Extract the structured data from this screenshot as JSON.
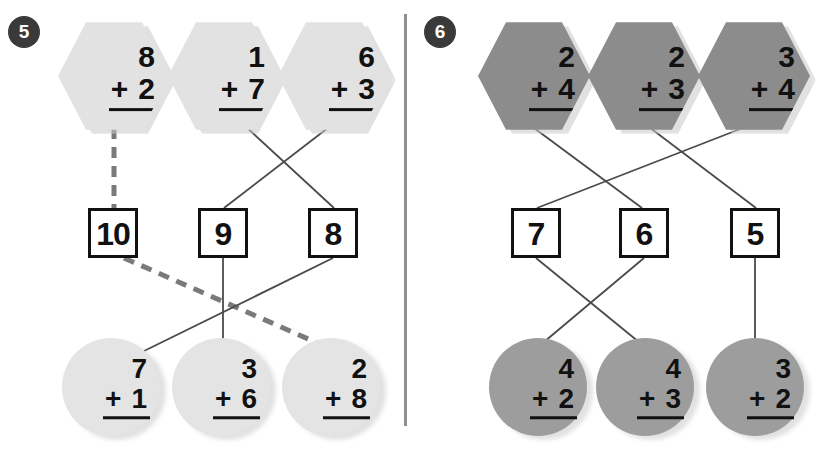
{
  "page": {
    "background": "#ffffff",
    "width": 818,
    "height": 453,
    "divider_color": "#8f8f8f"
  },
  "colors": {
    "hex_light": "#e2e2e2",
    "hex_dark": "#8c8c8c",
    "circle_light": "#e4e4e4",
    "circle_dark": "#9d9d9d",
    "ink": "#111111",
    "badge": "#3a3a3a",
    "solid_line": "#4a4a4a",
    "dashed_line": "#7a7a7a"
  },
  "problems": [
    {
      "number": "5",
      "top_row": [
        {
          "shape": "hexagon",
          "top": "8",
          "plus": "+",
          "bottom": "2"
        },
        {
          "shape": "hexagon",
          "top": "1",
          "plus": "+",
          "bottom": "7"
        },
        {
          "shape": "hexagon",
          "top": "6",
          "plus": "+",
          "bottom": "3"
        }
      ],
      "answers": [
        "10",
        "9",
        "8"
      ],
      "bottom_row": [
        {
          "shape": "circle",
          "top": "7",
          "plus": "+",
          "bottom": "1"
        },
        {
          "shape": "circle",
          "top": "3",
          "plus": "+",
          "bottom": "6"
        },
        {
          "shape": "circle",
          "top": "2",
          "plus": "+",
          "bottom": "8"
        }
      ],
      "links_top": [
        {
          "from": "hexagon-1",
          "to": "answer-10",
          "style": "dashed"
        },
        {
          "from": "hexagon-2",
          "to": "answer-8",
          "style": "solid"
        },
        {
          "from": "hexagon-3",
          "to": "answer-9",
          "style": "solid"
        }
      ],
      "links_bottom": [
        {
          "from": "answer-10",
          "to": "circle-2-plus-8",
          "style": "dashed"
        },
        {
          "from": "answer-9",
          "to": "circle-3-plus-6",
          "style": "solid"
        },
        {
          "from": "answer-8",
          "to": "circle-7-plus-1",
          "style": "solid"
        }
      ]
    },
    {
      "number": "6",
      "top_row": [
        {
          "shape": "hexagon",
          "top": "2",
          "plus": "+",
          "bottom": "4"
        },
        {
          "shape": "hexagon",
          "top": "2",
          "plus": "+",
          "bottom": "3"
        },
        {
          "shape": "hexagon",
          "top": "3",
          "plus": "+",
          "bottom": "4"
        }
      ],
      "answers": [
        "7",
        "6",
        "5"
      ],
      "bottom_row": [
        {
          "shape": "circle",
          "top": "4",
          "plus": "+",
          "bottom": "2"
        },
        {
          "shape": "circle",
          "top": "4",
          "plus": "+",
          "bottom": "3"
        },
        {
          "shape": "circle",
          "top": "3",
          "plus": "+",
          "bottom": "2"
        }
      ],
      "links_top": [
        {
          "from": "hexagon-1",
          "to": "answer-6",
          "style": "solid"
        },
        {
          "from": "hexagon-2",
          "to": "answer-5",
          "style": "solid"
        },
        {
          "from": "hexagon-3",
          "to": "answer-7",
          "style": "solid"
        }
      ],
      "links_bottom": [
        {
          "from": "answer-7",
          "to": "circle-4-plus-3",
          "style": "solid"
        },
        {
          "from": "answer-6",
          "to": "circle-4-plus-2",
          "style": "solid"
        },
        {
          "from": "answer-5",
          "to": "circle-3-plus-2",
          "style": "solid"
        }
      ]
    }
  ]
}
